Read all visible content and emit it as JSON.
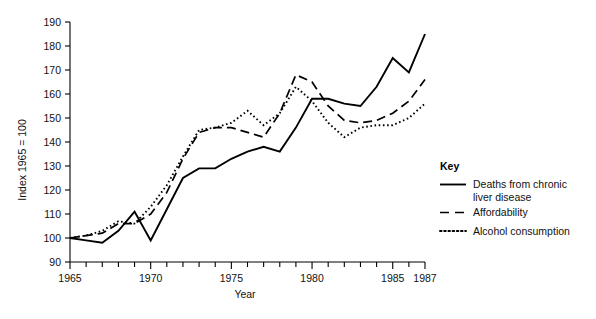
{
  "chart_data": {
    "type": "line",
    "title": "",
    "xlabel": "Year",
    "ylabel": "Index 1965 = 100",
    "xlim": [
      1965,
      1987
    ],
    "ylim": [
      90,
      190
    ],
    "ytick_labels": [
      "90",
      "100",
      "110",
      "120",
      "130",
      "140",
      "150",
      "160",
      "170",
      "180",
      "190"
    ],
    "yticks": [
      90,
      100,
      110,
      120,
      130,
      140,
      150,
      160,
      170,
      180,
      190
    ],
    "xtick_labels": [
      "1965",
      "1970",
      "1975",
      "1980",
      "1985",
      "1987"
    ],
    "xticks": [
      1965,
      1970,
      1975,
      1980,
      1985,
      1987
    ],
    "xticks_minor": [
      1966,
      1967,
      1968,
      1969,
      1971,
      1972,
      1973,
      1974,
      1976,
      1977,
      1978,
      1979,
      1981,
      1982,
      1983,
      1984,
      1986
    ],
    "grid": false,
    "legend_position": "right",
    "x": [
      1965,
      1966,
      1967,
      1968,
      1969,
      1970,
      1971,
      1972,
      1973,
      1974,
      1975,
      1976,
      1977,
      1978,
      1979,
      1980,
      1981,
      1982,
      1983,
      1984,
      1985,
      1986,
      1987
    ],
    "series": [
      {
        "name": "Deaths from chronic liver disease",
        "style": "solid",
        "values": [
          100,
          99,
          98,
          103,
          111,
          99,
          112,
          125,
          129,
          129,
          133,
          136,
          138,
          136,
          146,
          158,
          158,
          156,
          155,
          163,
          175,
          169,
          185
        ]
      },
      {
        "name": "Affordability",
        "style": "dashed",
        "values": [
          100,
          101,
          102,
          106,
          106,
          110,
          119,
          133,
          144,
          146,
          146,
          144,
          142,
          152,
          168,
          165,
          155,
          149,
          148,
          149,
          152,
          157,
          166
        ]
      },
      {
        "name": "Alcohol consumption",
        "style": "dotted",
        "values": [
          100,
          101,
          103,
          107,
          106,
          113,
          122,
          134,
          145,
          146,
          148,
          153,
          147,
          152,
          163,
          157,
          148,
          142,
          146,
          147,
          147,
          150,
          156
        ]
      }
    ]
  },
  "legend": {
    "title": "Key",
    "items": [
      {
        "label_line1": "Deaths from chronic",
        "label_line2": "liver disease",
        "style": "solid"
      },
      {
        "label_line1": "Affordability",
        "label_line2": "",
        "style": "dashed"
      },
      {
        "label_line1": "Alcohol consumption",
        "label_line2": "",
        "style": "dotted"
      }
    ]
  },
  "axes": {
    "y_title": "Index 1965 = 100",
    "x_title": "Year"
  }
}
